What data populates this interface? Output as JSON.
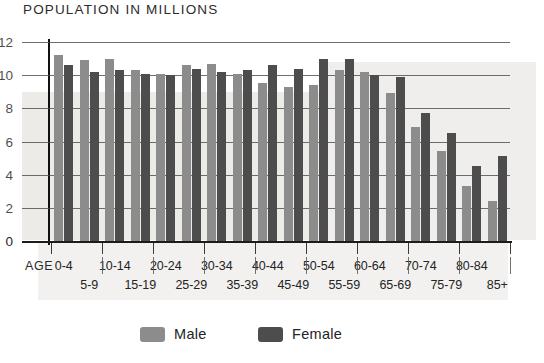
{
  "chart_data": {
    "type": "bar",
    "title": "POPULATION IN MILLIONS",
    "xlabel": "AGE",
    "ylabel": "",
    "ylim": [
      0,
      12
    ],
    "yticks": [
      0,
      2,
      4,
      6,
      8,
      10,
      12
    ],
    "ytick_labels": [
      "0",
      "2",
      "4",
      "6",
      "8",
      "10",
      "12"
    ],
    "grid": true,
    "legend_position": "bottom",
    "categories": [
      "0-4",
      "5-9",
      "10-14",
      "15-19",
      "20-24",
      "25-29",
      "30-34",
      "35-39",
      "40-44",
      "45-49",
      "50-54",
      "55-59",
      "60-64",
      "65-69",
      "70-74",
      "75-79",
      "80-84",
      "85+"
    ],
    "series": [
      {
        "name": "Male",
        "color": "#8c8c8c",
        "values": [
          11.2,
          10.9,
          11.0,
          10.3,
          10.1,
          10.6,
          10.7,
          10.1,
          9.5,
          9.3,
          9.4,
          10.3,
          10.2,
          8.9,
          6.9,
          5.4,
          3.3,
          2.4
        ]
      },
      {
        "name": "Female",
        "color": "#4d4d4d",
        "values": [
          10.6,
          10.2,
          10.3,
          10.1,
          10.0,
          10.4,
          10.2,
          10.3,
          10.6,
          10.4,
          11.0,
          11.0,
          10.0,
          9.9,
          7.7,
          6.5,
          4.5,
          5.1
        ]
      }
    ]
  },
  "legend": {
    "male_label": "Male",
    "female_label": "Female"
  },
  "axis": {
    "age_caption": "AGE"
  },
  "colors": {
    "male": "#8c8c8c",
    "female": "#4d4d4d",
    "grid": "#4a4a4a",
    "axis": "#111111",
    "page_tint": "#e9e8e4"
  }
}
